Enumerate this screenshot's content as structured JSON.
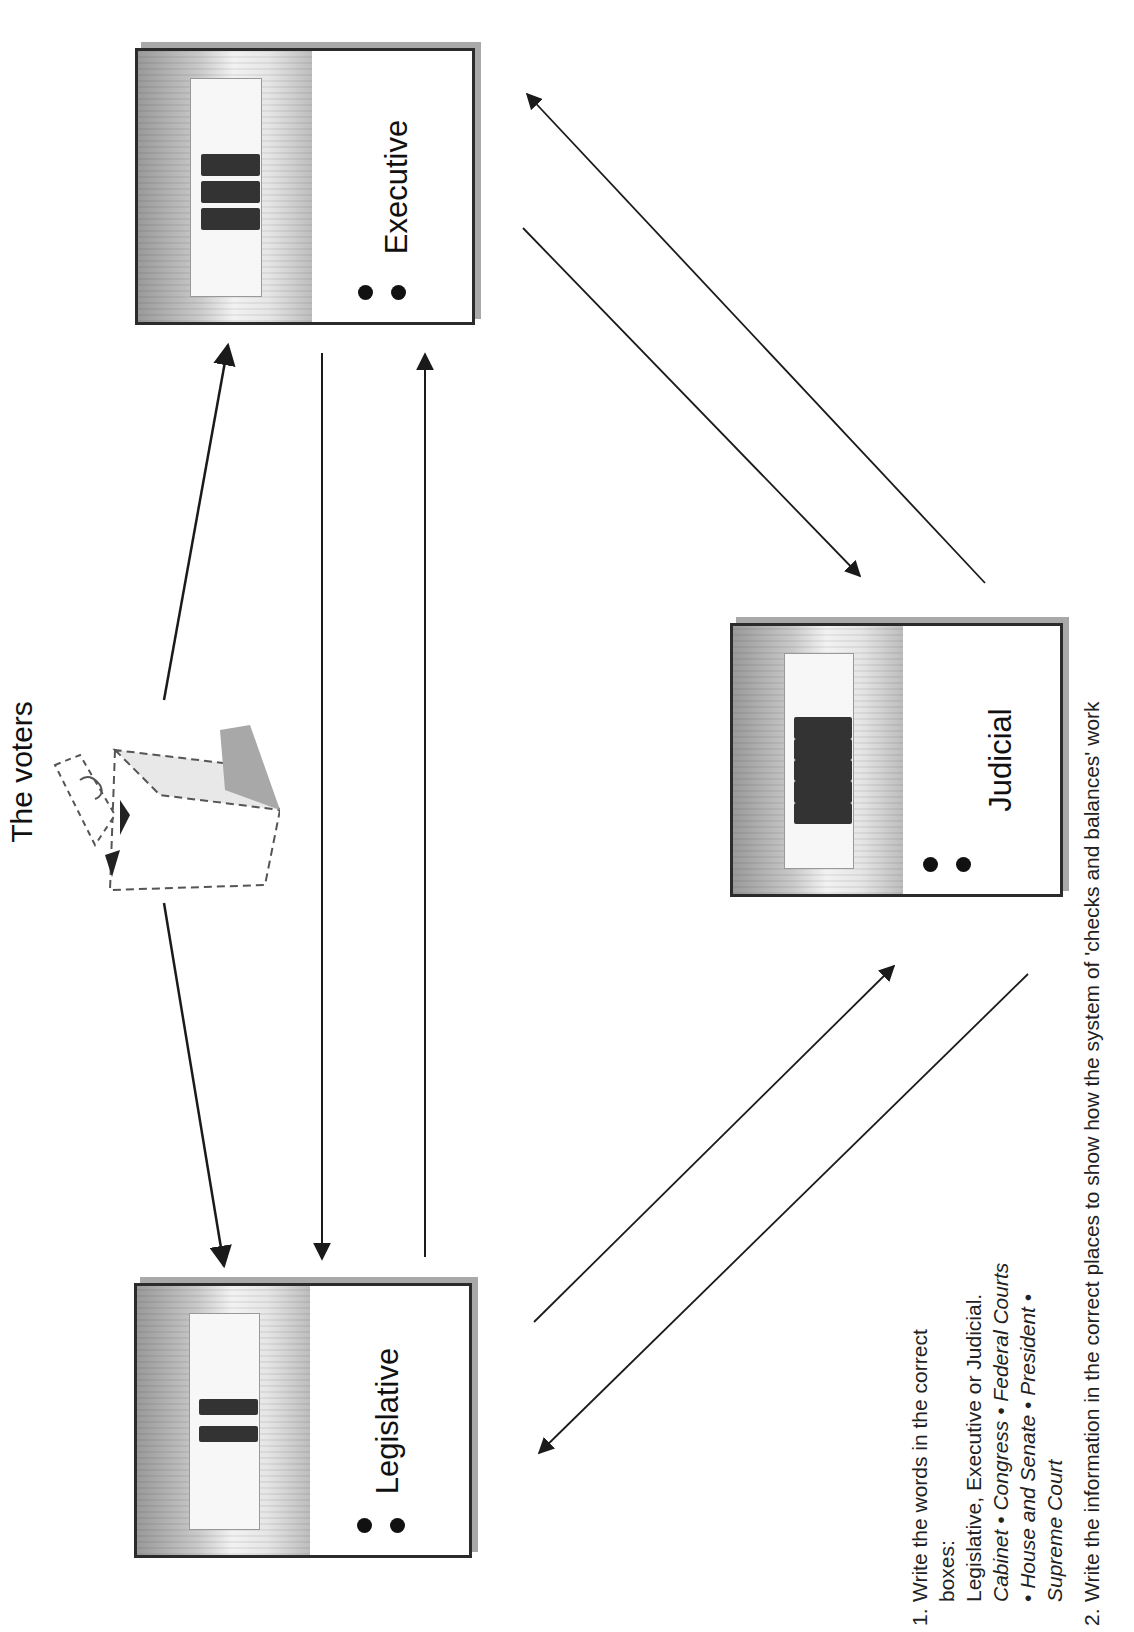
{
  "diagram": {
    "title": "The voters",
    "branches": [
      {
        "id": "executive",
        "label": "Executive",
        "bullet_count": 2,
        "image": "white-house-sketch"
      },
      {
        "id": "judicial",
        "label": "Judicial",
        "bullet_count": 2,
        "image": "supreme-court-sketch"
      },
      {
        "id": "legislative",
        "label": "Legislative",
        "bullet_count": 2,
        "image": "capitol-building-sketch"
      }
    ],
    "voter_icon": "ballot-box-icon",
    "arrows": [
      {
        "from": "voters",
        "to": "executive",
        "direction": "to-executive"
      },
      {
        "from": "voters",
        "to": "legislative",
        "direction": "to-legislative"
      },
      {
        "from": "executive",
        "to": "legislative",
        "direction": "down"
      },
      {
        "from": "legislative",
        "to": "executive",
        "direction": "up"
      },
      {
        "from": "judicial",
        "to": "executive",
        "direction": "up-left"
      },
      {
        "from": "executive",
        "to": "judicial",
        "direction": "down-right"
      },
      {
        "from": "legislative",
        "to": "judicial",
        "direction": "up-right"
      },
      {
        "from": "judicial",
        "to": "legislative",
        "direction": "down-left"
      }
    ],
    "colors": {
      "line": "#1a1a1a",
      "box_border": "#2b2b2b",
      "box_shadow": "#a9a9a9"
    }
  },
  "instructions": {
    "items": [
      {
        "number": "1.",
        "line1": "Write the words in the correct boxes:",
        "line2": "Legislative, Executive or Judicial.",
        "terms": [
          "Cabinet",
          "Congress",
          "Federal Courts",
          "House and Senate",
          "President",
          "Supreme Court"
        ],
        "separator": "•"
      },
      {
        "number": "2.",
        "text": "Write the information in the correct places to show how the system of 'checks and balances' work"
      }
    ]
  }
}
